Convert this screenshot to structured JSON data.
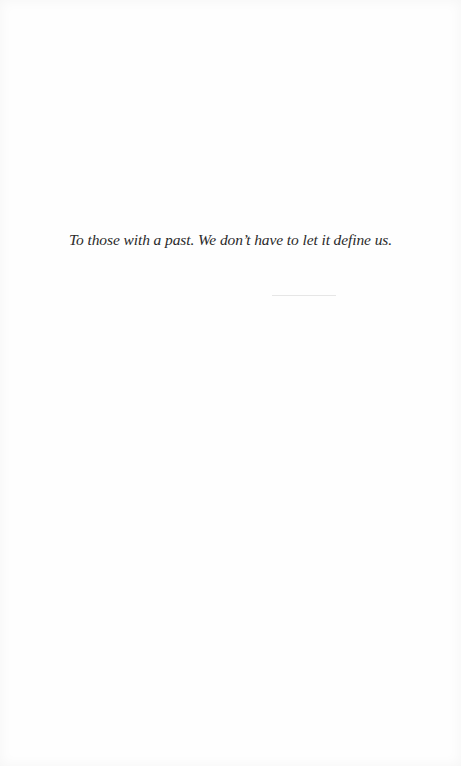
{
  "page": {
    "type": "dedication",
    "dedication_text": "To those with a past. We don’t have to let it define us.",
    "colors": {
      "background": "#fefefe",
      "text": "#2a2a2a",
      "rule": "#e6e6e6"
    }
  }
}
